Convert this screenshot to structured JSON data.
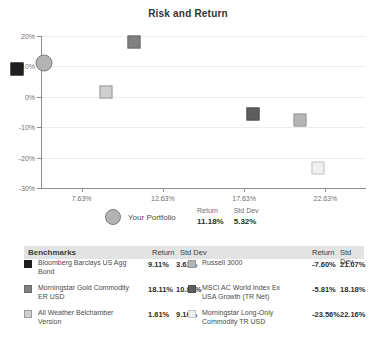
{
  "chart_data": {
    "type": "scatter",
    "title": "Risk and Return",
    "xlabel": "",
    "ylabel": "",
    "xlim": [
      5.13,
      25.13
    ],
    "ylim": [
      -30,
      20
    ],
    "xticks": [
      "7.63%",
      "12.63%",
      "17.63%",
      "22.63%"
    ],
    "xtick_values": [
      7.63,
      12.63,
      17.63,
      22.63
    ],
    "yticks": [
      "20%",
      "10%",
      "0%",
      "-10%",
      "-20%",
      "-30%"
    ],
    "ytick_values": [
      20,
      10,
      0,
      -10,
      -20,
      -30
    ],
    "grid": true,
    "legend_position": "below",
    "points": [
      {
        "name": "Your Portfolio",
        "x": 5.32,
        "y": 11.18,
        "marker": "circle",
        "color": "#b3b3b3",
        "border": "#7d7d7d",
        "size": 17
      },
      {
        "name": "Bloomberg Barclays US Agg Bond",
        "x": 3.63,
        "y": 9.11,
        "marker": "square",
        "color": "#1f1f1f",
        "border": "#1f1f1f",
        "size": 13
      },
      {
        "name": "Morningstar Gold Commodity ER USD",
        "x": 10.86,
        "y": 18.11,
        "marker": "square",
        "color": "#808080",
        "border": "#6b6b6b",
        "size": 13
      },
      {
        "name": "All Weather Belchamber Version",
        "x": 9.1,
        "y": 1.61,
        "marker": "square",
        "color": "#cfcfcf",
        "border": "#9a9a9a",
        "size": 13
      },
      {
        "name": "MSCI AC World Index Ex USA Growth (TR Net)",
        "x": 18.18,
        "y": -5.81,
        "marker": "square",
        "color": "#5e5e5e",
        "border": "#4f4f4f",
        "size": 13
      },
      {
        "name": "Russell 3000",
        "x": 21.07,
        "y": -7.6,
        "marker": "square",
        "color": "#b5b5b5",
        "border": "#9a9a9a",
        "size": 13
      },
      {
        "name": "Morningstar Long-Only Commodity TR USD",
        "x": 22.16,
        "y": -23.56,
        "marker": "square",
        "color": "#efefef",
        "border": "#c4c4c4",
        "size": 13
      }
    ]
  },
  "portfolio_legend": {
    "label": "Your Portfolio",
    "return_header": "Return",
    "stddev_header": "Std Dev",
    "return_value": "11.18%",
    "stddev_value": "5.32%"
  },
  "table": {
    "header": {
      "benchmarks": "Benchmarks",
      "return_left": "Return",
      "stddev_left": "Std Dev",
      "return_right": "Return",
      "stddev_right": "Std Dev"
    },
    "left_rows": [
      {
        "name": "Bloomberg Barclays US Agg Bond",
        "return": "9.11%",
        "stddev": "3.63%",
        "color": "#1f1f1f",
        "border": "#1f1f1f"
      },
      {
        "name": "Morningstar Gold Commodity ER USD",
        "return": "18.11%",
        "stddev": "10.86%",
        "color": "#808080",
        "border": "#6b6b6b"
      },
      {
        "name": "All Weather Belchamber Version",
        "return": "1.61%",
        "stddev": "9.10%",
        "color": "#cfcfcf",
        "border": "#9a9a9a"
      }
    ],
    "right_rows": [
      {
        "name": "Russell 3000",
        "return": "-7.60%",
        "stddev": "21.07%",
        "color": "#b5b5b5",
        "border": "#9a9a9a"
      },
      {
        "name": "MSCI AC World Index Ex USA Growth (TR Net)",
        "return": "-5.81%",
        "stddev": "18.18%",
        "color": "#5e5e5e",
        "border": "#4f4f4f"
      },
      {
        "name": "Morningstar Long-Only Commodity TR USD",
        "return": "-23.56%",
        "stddev": "22.16%",
        "color": "#efefef",
        "border": "#c4c4c4"
      }
    ]
  }
}
